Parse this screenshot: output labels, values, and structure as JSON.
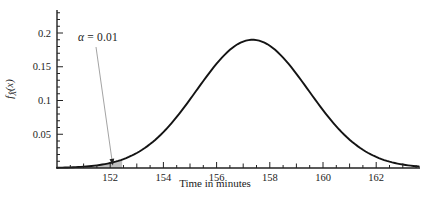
{
  "figure": {
    "annotation": {
      "symbol": "α",
      "rest": " = 0.01"
    },
    "x_axis": {
      "label": "Time in minutes",
      "tick_labels": [
        "152",
        "154",
        "156",
        "158",
        "160",
        "162"
      ]
    },
    "y_axis": {
      "label_f": "f",
      "label_sub": "X̂",
      "label_arg": "(x)",
      "tick_labels": [
        "0.05",
        "0.1",
        "0.15",
        "0.2"
      ]
    }
  },
  "chart_data": {
    "type": "line",
    "title": "",
    "xlabel": "Time in minutes",
    "ylabel": "f_X̂(x)",
    "xlim": [
      150,
      163.65
    ],
    "ylim": [
      0,
      0.234
    ],
    "grid": false,
    "x_major_ticks": [
      152,
      154,
      156,
      158,
      160,
      162
    ],
    "x_minor_step": 0.5,
    "y_major_ticks": [
      0.05,
      0.1,
      0.15,
      0.2
    ],
    "y_minor_step": 0.01,
    "series": [
      {
        "name": "sampling-distribution-pdf",
        "model": "gaussian",
        "mean": 157.35,
        "sd": 2.1,
        "peak_density": 0.19,
        "sample_points": {
          "x": [
            150,
            151,
            152,
            153,
            154,
            155,
            156,
            157,
            157.35,
            158,
            159,
            160,
            161,
            162,
            163,
            163.65
          ],
          "y": [
            0.0004,
            0.002,
            0.0074,
            0.0222,
            0.0532,
            0.1016,
            0.1545,
            0.1874,
            0.19,
            0.1811,
            0.1395,
            0.0857,
            0.042,
            0.0164,
            0.0051,
            0.0021
          ]
        }
      }
    ],
    "shaded_region": {
      "x_from": 150,
      "x_to": 152.45,
      "fill": "#bfbfbf",
      "label": "α = 0.01"
    },
    "annotation": {
      "text": "α = 0.01",
      "points_to_x": 152.1
    },
    "colors": {
      "curve": "#141414",
      "axis": "#222222",
      "text": "#1a1a1a",
      "arrow_line": "#999999",
      "arrow_head": "#222222"
    }
  }
}
